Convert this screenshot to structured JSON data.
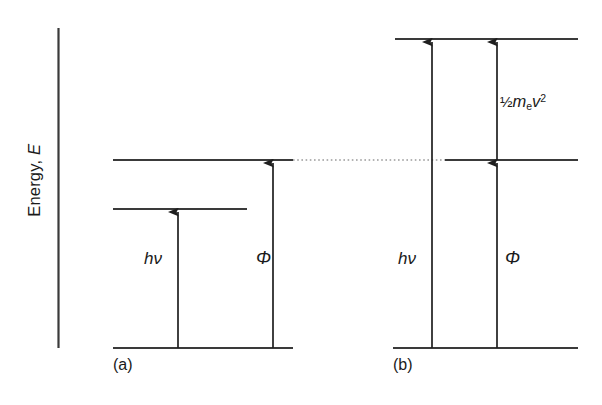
{
  "figure": {
    "axis": {
      "label_prefix": "Energy, ",
      "label_symbol": "E",
      "name": "vertical-energy-axis"
    },
    "colors": {
      "line": "#333333",
      "text": "#1a1a1a",
      "background": "#ffffff",
      "dotted": "#999999"
    },
    "panels": [
      {
        "tag": "(a)",
        "id": "panel-a",
        "description": "photon energy less than work function",
        "arrows": [
          {
            "id": "photon-energy",
            "label": "hν",
            "from_level": "baseline",
            "to_level": "excited"
          },
          {
            "id": "work-function",
            "label": "Φ",
            "from_level": "baseline",
            "to_level": "vacuum"
          }
        ],
        "levels": [
          {
            "id": "baseline-level",
            "name": "ground-state-level"
          },
          {
            "id": "excited-level",
            "name": "intermediate-level"
          },
          {
            "id": "vacuum-level",
            "name": "vacuum-level"
          }
        ]
      },
      {
        "tag": "(b)",
        "id": "panel-b",
        "description": "photon energy exceeds work function, excess becomes kinetic energy",
        "arrows": [
          {
            "id": "photon-energy",
            "label": "hν",
            "from_level": "baseline",
            "to_level": "top"
          },
          {
            "id": "work-function",
            "label": "Φ",
            "from_level": "baseline",
            "to_level": "vacuum"
          },
          {
            "id": "kinetic-energy",
            "label": "kinetic",
            "from_level": "vacuum",
            "to_level": "top"
          }
        ],
        "kinetic_energy": {
          "fraction": "½",
          "mass_symbol": "m",
          "mass_subscript": "e",
          "velocity_symbol": "v",
          "velocity_exponent": "2"
        },
        "levels": [
          {
            "id": "baseline-level",
            "name": "ground-state-level"
          },
          {
            "id": "vacuum-level",
            "name": "vacuum-level"
          },
          {
            "id": "top-level",
            "name": "photoelectron-level"
          }
        ]
      }
    ],
    "connector": {
      "id": "vacuum-level-connector",
      "style": "dotted",
      "description": "dotted line linking vacuum level across panels"
    }
  }
}
